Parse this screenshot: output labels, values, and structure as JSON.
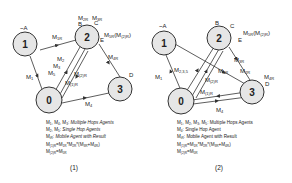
{
  "colors": {
    "node_fill": "#e6e6e6",
    "stroke": "#333333",
    "background": "#ffffff"
  },
  "diagram1": {
    "caption": "(1)",
    "nodes": [
      {
        "id": "1",
        "label": "1",
        "tag": "~A"
      },
      {
        "id": "2",
        "label": "2",
        "tags": [
          "B",
          "C",
          "E"
        ]
      },
      {
        "id": "0",
        "label": "0"
      },
      {
        "id": "3",
        "label": "3",
        "tag": "D"
      }
    ],
    "edge_labels": {
      "m1r": "M1R",
      "m2r": "M2R",
      "m3r": "M3R",
      "m5r_e": "M5R(M(2)R)",
      "m4r": "M4R",
      "m2": "M2",
      "m3": "M3",
      "m5": "M5",
      "m2_r": "M(2)R",
      "m1_r": "M(1)R",
      "m1": "M1",
      "m4": "M4"
    },
    "legend": [
      "M1, M4, M3: Multiple Hops Agents",
      "M2, M5: Single Hop Agents",
      "MiR: Mobile Agent with Result",
      "M(1)R=M1R*M2R*(M3R+M4R)",
      "M(2)R=M5R"
    ]
  },
  "diagram2": {
    "caption": "(2)",
    "nodes": [
      {
        "id": "1",
        "label": "1",
        "tag": "~A"
      },
      {
        "id": "2",
        "label": "2",
        "tags": [
          "B",
          "C",
          "E"
        ]
      },
      {
        "id": "0",
        "label": "0"
      },
      {
        "id": "3",
        "label": "3",
        "tag": "D"
      }
    ],
    "edge_labels": {
      "m5r_e": "M5R(M(2)R)",
      "m1": "M1",
      "m235": "M2,3,5",
      "m1r": "M1R",
      "m2r": "M2R",
      "m3r": "M3R",
      "m4r": "M4R",
      "m2_r": "M(2)R",
      "m1_r": "M(1)R",
      "m4": "M4"
    },
    "legend": [
      "M1, M2, M3, M5: Multiple Hops Agents",
      "M4: Single Hop Agent",
      "MiR: Mobile Agent with Result",
      "M(1)R=M1R*M2R*(M3R+M4R)",
      "M(2)R=M5R"
    ]
  }
}
